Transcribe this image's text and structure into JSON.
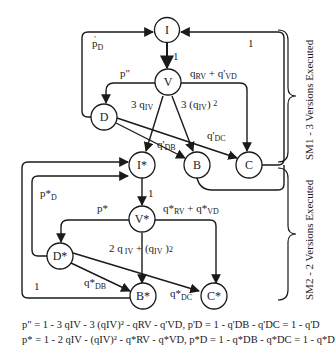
{
  "nodes": {
    "I": "I",
    "V": "V",
    "D": "D",
    "B": "B",
    "C": "C",
    "Istar": "I*",
    "Vstar": "V*",
    "Dstar": "D*",
    "Bstar": "B*",
    "Cstar": "C*"
  },
  "edges": {
    "I_V": "1",
    "D_I": "p'D",
    "C_I": "1",
    "V_D": "p\"",
    "V_C": "qRV + q'VD",
    "V_Istar_3qIV": "3 qIV",
    "V_B_3qIV2": "3 (qIV) 2",
    "D_B": "q'DB",
    "D_C": "q'DC",
    "Istar_Vstar": "1",
    "Dstar_Istar": "p*D",
    "Vstar_Dstar": "p*",
    "Vstar_Cstar": "q*RV + q*VD",
    "Vstar_Bstar": "2 qIV + (qIV)2",
    "Dstar_Bstar": "q*DB",
    "Dstar_Cstar": "q*DC",
    "Bstar_Istar": "1"
  },
  "side_labels": {
    "sm1": "SM1 - 3 Versions Executed",
    "sm2": "SM2 - 2 Versions Executed"
  },
  "equations": {
    "line1": "p\" = 1 - 3 qIV - 3 (qIV)² - qRV - q'VD,  p'D = 1 - q'DB - q'DC = 1 - q'D",
    "line2": "p* = 1 - 2 qIV - (qIV)² - q*RV - q*VD,  p*D = 1 - q*DB - q*DC = 1 - q*D"
  }
}
